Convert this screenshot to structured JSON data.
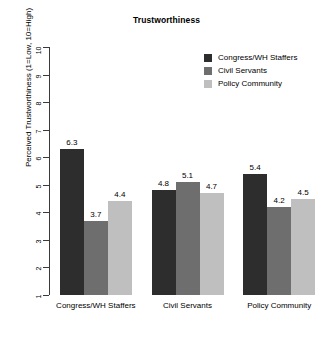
{
  "chart_data": {
    "type": "bar",
    "title": "Trustworthiness",
    "xlabel": "",
    "ylabel": "Perceived Trustworthiness (1=Low, 10=High)",
    "ylim": [
      1,
      10
    ],
    "yticks": [
      1,
      2,
      3,
      4,
      5,
      6,
      7,
      8,
      9,
      10
    ],
    "ytick_labels": [
      "1",
      "2",
      "3",
      "4",
      "5",
      "6",
      "7",
      "8",
      "9",
      "10"
    ],
    "grid": false,
    "legend_position": "top-right",
    "categories": [
      "Congress/WH Staffers",
      "Civil Servants",
      "Policy Community"
    ],
    "series": [
      {
        "name": "Congress/WH Staffers",
        "color": "#2d2d2d",
        "values": [
          6.3,
          4.8,
          5.4
        ],
        "value_labels": [
          "6.3",
          "4.8",
          "5.4"
        ]
      },
      {
        "name": "Civil Servants",
        "color": "#6e6e6e",
        "values": [
          3.7,
          5.1,
          4.2
        ],
        "value_labels": [
          "3.7",
          "5.1",
          "4.2"
        ]
      },
      {
        "name": "Policy Community",
        "color": "#bfbfbf",
        "values": [
          4.4,
          4.7,
          4.5
        ],
        "value_labels": [
          "4.4",
          "4.7",
          "4.5"
        ]
      }
    ]
  },
  "legend": {
    "items": [
      {
        "label": "Congress/WH Staffers",
        "color": "#2d2d2d"
      },
      {
        "label": "Civil Servants",
        "color": "#6e6e6e"
      },
      {
        "label": "Policy Community",
        "color": "#bfbfbf"
      }
    ]
  },
  "axis": {
    "line_color": "#3a3a3a"
  }
}
